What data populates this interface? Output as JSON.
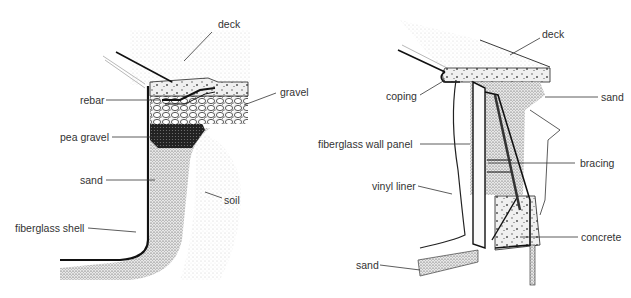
{
  "left_diagram": {
    "title": "fiberglass pool edge cross-section",
    "labels": {
      "deck": "deck",
      "gravel": "gravel",
      "rebar": "rebar",
      "pea_gravel": "pea gravel",
      "sand": "sand",
      "soil": "soil",
      "fiberglass_shell": "fiberglass shell"
    }
  },
  "right_diagram": {
    "title": "vinyl-liner pool wall cross-section",
    "labels": {
      "deck": "deck",
      "coping": "coping",
      "sand_top": "sand",
      "fiberglass_wall_panel": "fiberglass wall panel",
      "bracing": "bracing",
      "vinyl_liner": "vinyl liner",
      "concrete": "concrete",
      "sand_bottom": "sand"
    }
  }
}
